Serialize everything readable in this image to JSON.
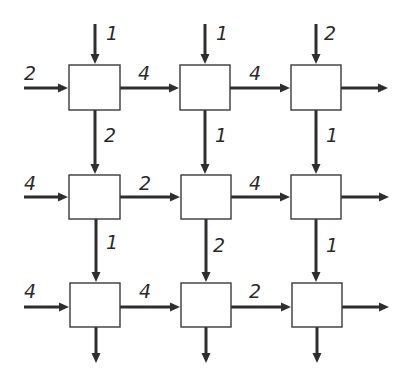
{
  "diagram": {
    "type": "grid-flow-network",
    "rows": 3,
    "cols": 3,
    "colors": {
      "stroke": "#2e2e2e",
      "box_fill": "#ffffff",
      "background": "#ffffff"
    },
    "nodes": [
      {
        "id": "n11",
        "row": 0,
        "col": 0,
        "x": 69,
        "y": 65,
        "w": 51,
        "h": 45
      },
      {
        "id": "n12",
        "row": 0,
        "col": 1,
        "x": 180,
        "y": 65,
        "w": 50,
        "h": 45
      },
      {
        "id": "n13",
        "row": 0,
        "col": 2,
        "x": 291,
        "y": 65,
        "w": 50,
        "h": 45
      },
      {
        "id": "n21",
        "row": 1,
        "col": 0,
        "x": 69,
        "y": 175,
        "w": 51,
        "h": 44
      },
      {
        "id": "n22",
        "row": 1,
        "col": 1,
        "x": 181,
        "y": 175,
        "w": 50,
        "h": 44
      },
      {
        "id": "n23",
        "row": 1,
        "col": 2,
        "x": 291,
        "y": 175,
        "w": 50,
        "h": 44
      },
      {
        "id": "n31",
        "row": 2,
        "col": 0,
        "x": 70,
        "y": 283,
        "w": 50,
        "h": 44
      },
      {
        "id": "n32",
        "row": 2,
        "col": 1,
        "x": 181,
        "y": 283,
        "w": 50,
        "h": 44
      },
      {
        "id": "n33",
        "row": 2,
        "col": 2,
        "x": 292,
        "y": 283,
        "w": 50,
        "h": 44
      }
    ],
    "edges": [
      {
        "id": "top-in-c1",
        "label": "1",
        "x1": 95,
        "y1": 24,
        "x2": 95,
        "y2": 64,
        "lx": 106,
        "ly": 40
      },
      {
        "id": "top-in-c2",
        "label": "1",
        "x1": 205,
        "y1": 24,
        "x2": 205,
        "y2": 64,
        "lx": 216,
        "ly": 40
      },
      {
        "id": "top-in-c3",
        "label": "2",
        "x1": 316,
        "y1": 24,
        "x2": 316,
        "y2": 64,
        "lx": 324,
        "ly": 40
      },
      {
        "id": "left-in-r1",
        "label": "2",
        "x1": 24,
        "y1": 88,
        "x2": 68,
        "y2": 88,
        "lx": 24,
        "ly": 80
      },
      {
        "id": "h-r1-c1c2",
        "label": "4",
        "x1": 120,
        "y1": 88,
        "x2": 179,
        "y2": 88,
        "lx": 138,
        "ly": 80
      },
      {
        "id": "h-r1-c2c3",
        "label": "4",
        "x1": 230,
        "y1": 88,
        "x2": 290,
        "y2": 88,
        "lx": 249,
        "ly": 80
      },
      {
        "id": "right-out-r1",
        "label": "",
        "x1": 341,
        "y1": 88,
        "x2": 388,
        "y2": 88,
        "lx": 0,
        "ly": 0
      },
      {
        "id": "v-c1-r1r2",
        "label": "2",
        "x1": 95,
        "y1": 110,
        "x2": 95,
        "y2": 174,
        "lx": 104,
        "ly": 142
      },
      {
        "id": "v-c2-r1r2",
        "label": "1",
        "x1": 205,
        "y1": 110,
        "x2": 205,
        "y2": 174,
        "lx": 215,
        "ly": 142
      },
      {
        "id": "v-c3-r1r2",
        "label": "1",
        "x1": 316,
        "y1": 110,
        "x2": 316,
        "y2": 174,
        "lx": 326,
        "ly": 142
      },
      {
        "id": "left-in-r2",
        "label": "4",
        "x1": 24,
        "y1": 197,
        "x2": 68,
        "y2": 197,
        "lx": 24,
        "ly": 190
      },
      {
        "id": "h-r2-c1c2",
        "label": "2",
        "x1": 120,
        "y1": 197,
        "x2": 180,
        "y2": 197,
        "lx": 139,
        "ly": 190
      },
      {
        "id": "h-r2-c2c3",
        "label": "4",
        "x1": 231,
        "y1": 197,
        "x2": 290,
        "y2": 197,
        "lx": 249,
        "ly": 190
      },
      {
        "id": "right-out-r2",
        "label": "",
        "x1": 341,
        "y1": 197,
        "x2": 389,
        "y2": 197,
        "lx": 0,
        "ly": 0
      },
      {
        "id": "v-c1-r2r3",
        "label": "1",
        "x1": 96,
        "y1": 219,
        "x2": 96,
        "y2": 282,
        "lx": 106,
        "ly": 249
      },
      {
        "id": "v-c2-r2r3",
        "label": "2",
        "x1": 206,
        "y1": 219,
        "x2": 206,
        "y2": 282,
        "lx": 213,
        "ly": 252
      },
      {
        "id": "v-c3-r2r3",
        "label": "1",
        "x1": 316,
        "y1": 219,
        "x2": 316,
        "y2": 282,
        "lx": 326,
        "ly": 252
      },
      {
        "id": "left-in-r3",
        "label": "4",
        "x1": 24,
        "y1": 307,
        "x2": 69,
        "y2": 307,
        "lx": 24,
        "ly": 298
      },
      {
        "id": "h-r3-c1c2",
        "label": "4",
        "x1": 120,
        "y1": 307,
        "x2": 180,
        "y2": 307,
        "lx": 139,
        "ly": 298
      },
      {
        "id": "h-r3-c2c3",
        "label": "2",
        "x1": 231,
        "y1": 307,
        "x2": 291,
        "y2": 307,
        "lx": 249,
        "ly": 298
      },
      {
        "id": "right-out-r3",
        "label": "",
        "x1": 342,
        "y1": 307,
        "x2": 389,
        "y2": 307,
        "lx": 0,
        "ly": 0
      },
      {
        "id": "bottom-out-c1",
        "label": "",
        "x1": 96,
        "y1": 327,
        "x2": 96,
        "y2": 363,
        "lx": 0,
        "ly": 0
      },
      {
        "id": "bottom-out-c2",
        "label": "",
        "x1": 206,
        "y1": 327,
        "x2": 206,
        "y2": 363,
        "lx": 0,
        "ly": 0
      },
      {
        "id": "bottom-out-c3",
        "label": "",
        "x1": 317,
        "y1": 327,
        "x2": 317,
        "y2": 363,
        "lx": 0,
        "ly": 0
      }
    ]
  }
}
